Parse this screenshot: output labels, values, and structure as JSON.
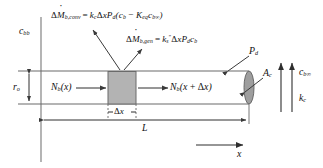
{
  "figure": {
    "background": "#ffffff",
    "line_color": "#555555",
    "control_volume_fill": "#b3b3b3",
    "end_cap_fill": "#9e9e9e",
    "text_color": "#111111",
    "width": 323,
    "height": 168
  },
  "labels": {
    "bulk_concentration_left": {
      "base": "c",
      "sub": "bb"
    },
    "pipe_radius": {
      "base": "r",
      "sub": "o"
    },
    "flux_in": {
      "base": "N",
      "sub": "b",
      "arg": "(x)"
    },
    "flux_out": {
      "base": "N",
      "sub": "b",
      "arg": "(x + Δx)"
    },
    "delta_x": "Δx",
    "length": "L",
    "axis_x": "x",
    "perimeter": {
      "base": "P",
      "sub": "d"
    },
    "cross_section_area": {
      "base": "A",
      "sub": "c"
    },
    "wall_concentration": {
      "base": "c",
      "sub": "b∞"
    },
    "mass_transfer_coefficient": {
      "base": "k",
      "sub": "c"
    }
  },
  "equations": {
    "convection": {
      "lhs_delta": "Δ",
      "lhs_symbol": "M",
      "lhs_sub": "b,conv",
      "equals": "=",
      "rhs": [
        {
          "base": "k",
          "sub": "c"
        },
        {
          "base": "Δx",
          "sub": ""
        },
        {
          "base": "P",
          "sub": "d"
        },
        {
          "base": "(c",
          "sub": "b"
        },
        {
          "base": " − K",
          "sub": "eq"
        },
        {
          "base": "c",
          "sub": "b∞"
        },
        {
          "base": ")",
          "sub": ""
        }
      ],
      "plain_text": "ΔṀb,conv = kcΔxPd(cb − Keq cb∞)"
    },
    "generation": {
      "lhs_delta": "Δ",
      "lhs_symbol": "M",
      "lhs_sub": "b,gen",
      "equals": "=",
      "rhs": [
        {
          "base": "k",
          "sub": "s",
          "sup": "″"
        },
        {
          "base": "Δx",
          "sub": ""
        },
        {
          "base": "P",
          "sub": "d"
        },
        {
          "base": "c",
          "sub": "b"
        }
      ],
      "plain_text": "ΔṀb,gen = ks″ΔxPd cb"
    }
  },
  "geometry": {
    "pipe": {
      "x_left": 41,
      "x_right": 249,
      "y_top": 71,
      "y_bottom": 104
    },
    "control_volume": {
      "x_left": 108,
      "x_right": 136
    },
    "end_cap_rx": 5,
    "left_vertical_rule_x": 41,
    "dimension_line_L_y": 120,
    "dimension_line_dx_y": 112,
    "axis_arrow": {
      "x_start": 196,
      "x_end": 243,
      "y": 145
    }
  }
}
